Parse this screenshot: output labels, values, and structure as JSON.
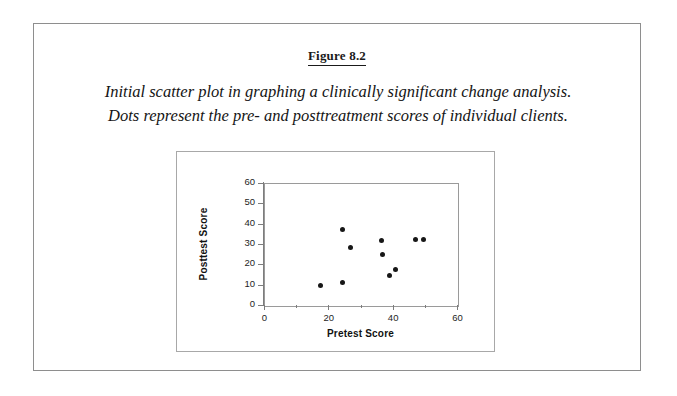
{
  "figure": {
    "title": "Figure 8.2",
    "caption_line_1": "Initial scatter plot in graphing a clinically significant change analysis.",
    "caption_line_2": "Dots represent the pre- and posttreatment scores of individual clients."
  },
  "colors": {
    "page_border": "#8e8e8e",
    "chart_border": "#a8a8a8",
    "axis": "#7d7d7d",
    "marker": "#171717",
    "text": "#111111",
    "background": "#ffffff"
  },
  "chart_data": {
    "type": "scatter",
    "title": "",
    "xlabel": "Pretest Score",
    "ylabel": "Posttest Score",
    "xlim": [
      0,
      60
    ],
    "ylim": [
      0,
      60
    ],
    "xticks": [
      0,
      20,
      40,
      60
    ],
    "xticks_labels": [
      "0",
      "20",
      "40",
      "60"
    ],
    "xminor_ticks": [
      10,
      30,
      50
    ],
    "yticks": [
      0,
      10,
      20,
      30,
      40,
      50,
      60
    ],
    "yticks_labels": [
      "0",
      "10",
      "20",
      "30",
      "40",
      "50",
      "60"
    ],
    "grid": false,
    "legend": false,
    "marker": "filled-circle",
    "series": [
      {
        "name": "Clients",
        "points": [
          {
            "x": 17.5,
            "y": 9.8
          },
          {
            "x": 24.5,
            "y": 11.0
          },
          {
            "x": 24.3,
            "y": 37.0
          },
          {
            "x": 27.0,
            "y": 28.5
          },
          {
            "x": 36.5,
            "y": 31.7
          },
          {
            "x": 36.7,
            "y": 24.7
          },
          {
            "x": 39.0,
            "y": 14.7
          },
          {
            "x": 41.0,
            "y": 17.5
          },
          {
            "x": 47.0,
            "y": 32.3
          },
          {
            "x": 49.5,
            "y": 32.3
          }
        ]
      }
    ]
  }
}
